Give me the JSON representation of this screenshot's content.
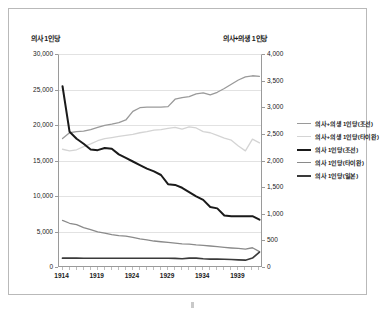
{
  "chart_data": {
    "type": "line",
    "title": "",
    "xlabel": "",
    "ylabel": "의사 1인당",
    "y2label": "의사+의생 1인당",
    "grid": true,
    "legend_position": "right",
    "xlim": [
      1914,
      1942
    ],
    "ylim": [
      0,
      30000
    ],
    "y2lim": [
      0,
      4000
    ],
    "x": [
      1914,
      1915,
      1916,
      1917,
      1918,
      1919,
      1920,
      1921,
      1922,
      1923,
      1924,
      1925,
      1926,
      1927,
      1928,
      1929,
      1930,
      1931,
      1932,
      1933,
      1934,
      1935,
      1936,
      1937,
      1938,
      1939,
      1940,
      1941,
      1942
    ],
    "xticks": [
      "1914",
      "1919",
      "1924",
      "1929",
      "1934",
      "1939"
    ],
    "yticks": [
      "0",
      "5,000",
      "10,000",
      "15,000",
      "20,000",
      "25,000",
      "30,000"
    ],
    "y2ticks": [
      "0",
      "500",
      "1,000",
      "1,500",
      "2,000",
      "2,500",
      "3,000",
      "3,500",
      "4,000"
    ],
    "series": [
      {
        "name": "의사+의생 1인당(조선)",
        "axis": "right",
        "color": "#9a9a9a",
        "width": 1.3,
        "values": [
          2430,
          2540,
          2560,
          2570,
          2600,
          2640,
          2680,
          2700,
          2730,
          2780,
          2940,
          3010,
          3020,
          3020,
          3020,
          3030,
          3170,
          3200,
          3220,
          3270,
          3290,
          3250,
          3300,
          3370,
          3450,
          3530,
          3590,
          3610,
          3600
        ]
      },
      {
        "name": "의사+의생 1인당(타이완)",
        "axis": "right",
        "color": "#d4d4d4",
        "width": 1.3,
        "values": [
          2230,
          2200,
          2220,
          2280,
          2330,
          2390,
          2430,
          2450,
          2470,
          2490,
          2510,
          2540,
          2560,
          2590,
          2600,
          2620,
          2640,
          2610,
          2650,
          2630,
          2560,
          2540,
          2490,
          2440,
          2400,
          2290,
          2200,
          2420,
          2350
        ]
      },
      {
        "name": "의사 1인당(조선)",
        "axis": "left",
        "color": "#1a1a1a",
        "width": 2.0,
        "values": [
          25600,
          19200,
          18200,
          17500,
          16700,
          16600,
          16900,
          16800,
          16000,
          15500,
          15000,
          14500,
          14000,
          13600,
          13100,
          11800,
          11700,
          11300,
          10700,
          10100,
          9600,
          8600,
          8400,
          7400,
          7300,
          7300,
          7300,
          7300,
          6800
        ]
      },
      {
        "name": "의사 1인당(타이완)",
        "axis": "left",
        "color": "#8a8a8a",
        "width": 1.3,
        "values": [
          6700,
          6300,
          6100,
          5700,
          5400,
          5100,
          4900,
          4700,
          4550,
          4500,
          4300,
          4100,
          3950,
          3800,
          3700,
          3600,
          3500,
          3400,
          3350,
          3250,
          3200,
          3100,
          3000,
          2900,
          2820,
          2750,
          2650,
          2850,
          2300
        ]
      },
      {
        "name": "의사 1인당(일본)",
        "axis": "left",
        "color": "#3a3a3a",
        "width": 1.7,
        "values": [
          1380,
          1380,
          1380,
          1370,
          1370,
          1370,
          1370,
          1370,
          1370,
          1370,
          1370,
          1370,
          1370,
          1370,
          1370,
          1370,
          1350,
          1300,
          1400,
          1380,
          1300,
          1250,
          1250,
          1230,
          1200,
          1150,
          1100,
          1400,
          2250
        ]
      }
    ]
  },
  "axes": {
    "left_title": "의사 1인당",
    "right_title": "의사+의생 1인당"
  }
}
